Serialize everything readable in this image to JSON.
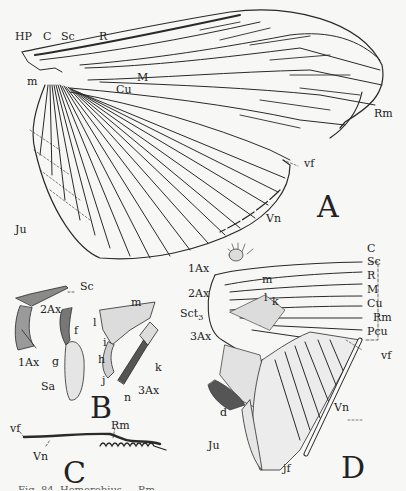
{
  "figure": {
    "panels": {
      "A": {
        "letter": "A",
        "labels": {
          "hp": "HP",
          "c": "C",
          "sc": "Sc",
          "r": "R",
          "m_vein": "M",
          "cu": "Cu",
          "m": "m",
          "rm": "Rm",
          "vf": "vf",
          "vn": "Vn",
          "ju": "Ju"
        }
      },
      "B": {
        "letter": "B",
        "labels": {
          "sc": "Sc",
          "ax1": "1Ax",
          "ax2": "2Ax",
          "f": "f",
          "g": "g",
          "sa": "Sa",
          "m": "m",
          "l": "l",
          "i": "i",
          "h": "h",
          "j": "j",
          "k": "k",
          "n": "n",
          "ax3": "3Ax"
        }
      },
      "C": {
        "letter": "C",
        "labels": {
          "vf": "vf",
          "vn": "Vn",
          "rm": "Rm"
        }
      },
      "D": {
        "letter": "D",
        "labels": {
          "ax1": "1Ax",
          "ax2": "2Ax",
          "sct3": "Sct",
          "sct3_sub": "3",
          "ax3": "3Ax",
          "m": "m",
          "l": "l",
          "k": "k",
          "c": "C",
          "sc": "Sc",
          "r": "R",
          "m_vein": "M",
          "cu": "Cu",
          "rm": "Rm",
          "pcu": "Pcu",
          "vf": "vf",
          "vn": "Vn",
          "d": "d",
          "ju": "Ju",
          "jf": "jf"
        }
      }
    },
    "caption": "Fig. 84. Hemerobius ... Rm ... "
  }
}
